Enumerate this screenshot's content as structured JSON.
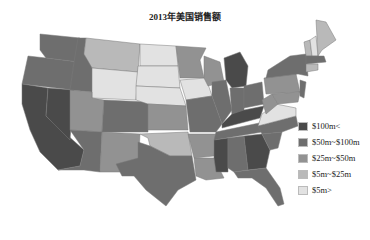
{
  "chart_data": {
    "type": "choropleth-map",
    "title": "2013年美国销售额",
    "legend": [
      {
        "label": "$100m<",
        "color": "#4a4a4a"
      },
      {
        "label": "$50m~$100m",
        "color": "#6e6e6e"
      },
      {
        "label": "$25m~$50m",
        "color": "#929292"
      },
      {
        "label": "$5m~$25m",
        "color": "#b9b9b9"
      },
      {
        "label": "$5m>",
        "color": "#e2e2e2"
      }
    ],
    "states": {
      "CA": "$100m<",
      "NV": "$100m<",
      "MI": "$100m<",
      "GA": "$100m<",
      "MS": "$100m<",
      "KY": "$100m<",
      "WA": "$50m~$100m",
      "OR": "$50m~$100m",
      "ID": "$50m~$100m",
      "AZ": "$50m~$100m",
      "CO": "$50m~$100m",
      "TX": "$50m~$100m",
      "MO": "$50m~$100m",
      "IL": "$50m~$100m",
      "IN": "$50m~$100m",
      "OH": "$50m~$100m",
      "TN": "$50m~$100m",
      "AL": "$50m~$100m",
      "FL": "$50m~$100m",
      "SC": "$50m~$100m",
      "NC": "$50m~$100m",
      "NY": "$50m~$100m",
      "NJ": "$50m~$100m",
      "MA": "$50m~$100m",
      "UT": "$25m~$50m",
      "NM": "$25m~$50m",
      "KS": "$25m~$50m",
      "AR": "$25m~$50m",
      "LA": "$25m~$50m",
      "WI": "$25m~$50m",
      "MN": "$25m~$50m",
      "WV": "$25m~$50m",
      "PA": "$25m~$50m",
      "MD": "$25m~$50m",
      "MT": "$5m~$25m",
      "OK": "$5m~$25m",
      "ME": "$5m~$25m",
      "VT": "$5m~$25m",
      "CT": "$5m~$25m",
      "WY": "$5m>",
      "ND": "$5m>",
      "SD": "$5m>",
      "NE": "$5m>",
      "IA": "$5m>",
      "VA": "$5m>",
      "NH": "$5m>"
    }
  }
}
